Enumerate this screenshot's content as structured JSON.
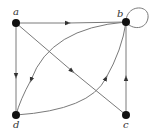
{
  "diagram": {
    "type": "directed-graph",
    "colors": {
      "edge": "#7a7a7a",
      "node": "#111111",
      "label": "#333333"
    },
    "nodes": [
      {
        "id": "a",
        "label": "a",
        "x": 16,
        "y": 23
      },
      {
        "id": "b",
        "label": "b",
        "x": 126,
        "y": 22
      },
      {
        "id": "c",
        "label": "c",
        "x": 126,
        "y": 115
      },
      {
        "id": "d",
        "label": "d",
        "x": 16,
        "y": 115
      }
    ],
    "edges": [
      {
        "from": "a",
        "to": "b",
        "shape": "straight"
      },
      {
        "from": "a",
        "to": "d",
        "shape": "straight"
      },
      {
        "from": "a",
        "to": "c",
        "shape": "straight"
      },
      {
        "from": "c",
        "to": "b",
        "shape": "straight"
      },
      {
        "from": "b",
        "to": "d",
        "shape": "curve"
      },
      {
        "from": "d",
        "to": "b",
        "shape": "curve"
      },
      {
        "from": "b",
        "to": "b",
        "shape": "loop"
      }
    ]
  }
}
